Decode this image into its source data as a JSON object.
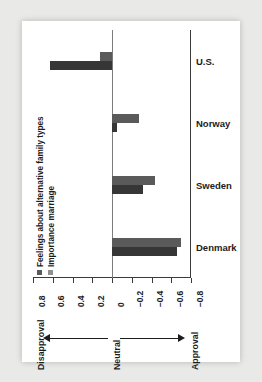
{
  "chart_data": {
    "type": "bar",
    "orientation": "horizontal",
    "title": "",
    "subtitle": "",
    "xlabel": "",
    "ylabel": "",
    "categories": [
      "U.S.",
      "Norway",
      "Sweden",
      "Denmark"
    ],
    "series": [
      {
        "name": "Feelings about alternative family types",
        "color": "#5a5a5a",
        "values": [
          0.12,
          -0.27,
          -0.44,
          -0.7
        ]
      },
      {
        "name": "Importance marriage",
        "color": "#363636",
        "values": [
          0.63,
          -0.05,
          -0.31,
          -0.66
        ]
      }
    ],
    "axis_ticks": [
      "0.8",
      "0.6",
      "0.4",
      "0.2",
      "0",
      "-0.2",
      "-0.4",
      "-0.6",
      "-0.8"
    ],
    "tick_display": [
      "0.8",
      "0.6",
      "0.4",
      "0.2",
      "0",
      "−0.2",
      "−0.4",
      "−0.6",
      "−0.8"
    ],
    "xlim": [
      0.8,
      -0.8
    ],
    "grid": false,
    "legend_position": "inside-left-rotated",
    "annotations": {
      "left": "Disapproval",
      "center": "Neutral",
      "right": "Approval"
    }
  },
  "legend": {
    "items": [
      {
        "label": "Feelings about alternative family types",
        "color": "#5a5a5a"
      },
      {
        "label": "Importance marriage",
        "color": "#8f8f8f"
      }
    ]
  },
  "axis": {
    "ticks": [
      "0.8",
      "0.6",
      "0.4",
      "0.2",
      "0",
      "−0.2",
      "−0.4",
      "−0.6",
      "−0.8"
    ]
  },
  "categories": [
    "U.S.",
    "Norway",
    "Sweden",
    "Denmark"
  ],
  "annotations": {
    "disapproval": "Disapproval",
    "neutral": "Neutral",
    "approval": "Approval"
  }
}
